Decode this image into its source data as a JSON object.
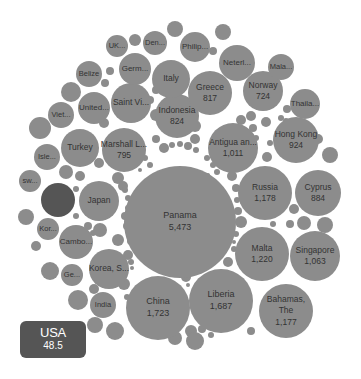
{
  "chart_data": {
    "type": "bubble",
    "title": "",
    "highlighted": "USA",
    "colors": {
      "bubble": "#8c8c8c",
      "highlight": "#555555",
      "label": "#333333",
      "tooltip_bg": "#555555",
      "tooltip_text": "#ffffff"
    },
    "bubbles": [
      {
        "label": "Panama",
        "value": "5,473",
        "cx": 180,
        "cy": 222,
        "r": 56
      },
      {
        "label": "China",
        "value": "1,723",
        "cx": 158,
        "cy": 308,
        "r": 32
      },
      {
        "label": "Liberia",
        "value": "1,687",
        "cx": 221,
        "cy": 301,
        "r": 32
      },
      {
        "label": "Malta",
        "value": "1,220",
        "cx": 262,
        "cy": 254,
        "r": 27
      },
      {
        "label": "Russia",
        "value": "1,178",
        "cx": 265,
        "cy": 193,
        "r": 27
      },
      {
        "label": "Bahamas, The",
        "value": "1,177",
        "cx": 286,
        "cy": 311,
        "r": 27
      },
      {
        "label": "Singapore",
        "value": "1,063",
        "cx": 315,
        "cy": 256,
        "r": 25
      },
      {
        "label": "Antigua an...",
        "value": "1,011",
        "cx": 233,
        "cy": 148,
        "r": 25
      },
      {
        "label": "Hong Kong",
        "value": "924",
        "cx": 296,
        "cy": 140,
        "r": 23
      },
      {
        "label": "Cyprus",
        "value": "884",
        "cx": 318,
        "cy": 193,
        "r": 23
      },
      {
        "label": "Indonesia",
        "value": "824",
        "cx": 177,
        "cy": 116,
        "r": 22
      },
      {
        "label": "Greece",
        "value": "817",
        "cx": 210,
        "cy": 93,
        "r": 22
      },
      {
        "label": "Marshall L...",
        "value": "795",
        "cx": 124,
        "cy": 150,
        "r": 22
      },
      {
        "label": "Norway",
        "value": "724",
        "cx": 263,
        "cy": 91,
        "r": 20
      },
      {
        "label": "Japan",
        "value": "",
        "cx": 99,
        "cy": 201,
        "r": 20
      },
      {
        "label": "Turkey",
        "value": "",
        "cx": 80,
        "cy": 148,
        "r": 19
      },
      {
        "label": "Saint Vi...",
        "value": "",
        "cx": 131,
        "cy": 103,
        "r": 20
      },
      {
        "label": "Italy",
        "value": "",
        "cx": 171,
        "cy": 79,
        "r": 19
      },
      {
        "label": "Korea, S...",
        "value": "",
        "cx": 109,
        "cy": 269,
        "r": 20
      },
      {
        "label": "Cambo...",
        "value": "",
        "cx": 76,
        "cy": 242,
        "r": 17
      },
      {
        "label": "United...",
        "value": "",
        "cx": 94,
        "cy": 108,
        "r": 16
      },
      {
        "label": "Germ...",
        "value": "",
        "cx": 135,
        "cy": 69,
        "r": 16
      },
      {
        "label": "Neterl...",
        "value": "",
        "cx": 237,
        "cy": 63,
        "r": 18
      },
      {
        "label": "Thaila...",
        "value": "",
        "cx": 305,
        "cy": 104,
        "r": 15
      },
      {
        "label": "Philip...",
        "value": "",
        "cx": 195,
        "cy": 47,
        "r": 15
      },
      {
        "label": "Belize",
        "value": "",
        "cx": 89,
        "cy": 74,
        "r": 13
      },
      {
        "label": "Viet...",
        "value": "",
        "cx": 61,
        "cy": 115,
        "r": 13
      },
      {
        "label": "Isle...",
        "value": "",
        "cx": 47,
        "cy": 157,
        "r": 13
      },
      {
        "label": "India",
        "value": "",
        "cx": 103,
        "cy": 305,
        "r": 13
      },
      {
        "label": "Den...",
        "value": "",
        "cx": 155,
        "cy": 43,
        "r": 12
      },
      {
        "label": "UK...",
        "value": "",
        "cx": 117,
        "cy": 46,
        "r": 11
      },
      {
        "label": "Mala...",
        "value": "",
        "cx": 281,
        "cy": 67,
        "r": 13
      },
      {
        "label": "Ge...",
        "value": "",
        "cx": 72,
        "cy": 275,
        "r": 11
      },
      {
        "label": "Kor...",
        "value": "",
        "cx": 48,
        "cy": 229,
        "r": 11
      },
      {
        "label": "sw...",
        "value": "",
        "cx": 30,
        "cy": 181,
        "r": 11
      },
      {
        "label": "",
        "value": "",
        "cx": 58,
        "cy": 200,
        "r": 17,
        "highlight": true
      }
    ],
    "small_bubbles": [
      {
        "cx": 135,
        "cy": 40,
        "r": 6
      },
      {
        "cx": 175,
        "cy": 29,
        "r": 8
      },
      {
        "cx": 223,
        "cy": 32,
        "r": 8
      },
      {
        "cx": 213,
        "cy": 51,
        "r": 4
      },
      {
        "cx": 110,
        "cy": 71,
        "r": 4
      },
      {
        "cx": 105,
        "cy": 83,
        "r": 4
      },
      {
        "cx": 40,
        "cy": 128,
        "r": 11
      },
      {
        "cx": 71,
        "cy": 92,
        "r": 10
      },
      {
        "cx": 26,
        "cy": 217,
        "r": 8
      },
      {
        "cx": 36,
        "cy": 246,
        "r": 5
      },
      {
        "cx": 50,
        "cy": 271,
        "r": 9
      },
      {
        "cx": 78,
        "cy": 300,
        "r": 10
      },
      {
        "cx": 95,
        "cy": 325,
        "r": 8
      },
      {
        "cx": 115,
        "cy": 331,
        "r": 9
      },
      {
        "cx": 66,
        "cy": 172,
        "r": 7
      },
      {
        "cx": 80,
        "cy": 176,
        "r": 5
      },
      {
        "cx": 76,
        "cy": 189,
        "r": 3
      },
      {
        "cx": 76,
        "cy": 216,
        "r": 3
      },
      {
        "cx": 99,
        "cy": 163,
        "r": 5
      },
      {
        "cx": 118,
        "cy": 178,
        "r": 6
      },
      {
        "cx": 123,
        "cy": 186,
        "r": 5
      },
      {
        "cx": 104,
        "cy": 123,
        "r": 5
      },
      {
        "cx": 156,
        "cy": 115,
        "r": 6
      },
      {
        "cx": 150,
        "cy": 100,
        "r": 4
      },
      {
        "cx": 156,
        "cy": 90,
        "r": 4
      },
      {
        "cx": 166,
        "cy": 104,
        "r": 3
      },
      {
        "cx": 195,
        "cy": 126,
        "r": 6
      },
      {
        "cx": 195,
        "cy": 139,
        "r": 5
      },
      {
        "cx": 156,
        "cy": 139,
        "r": 4
      },
      {
        "cx": 164,
        "cy": 148,
        "r": 5
      },
      {
        "cx": 172,
        "cy": 145,
        "r": 3
      },
      {
        "cx": 180,
        "cy": 144,
        "r": 3
      },
      {
        "cx": 188,
        "cy": 146,
        "r": 4
      },
      {
        "cx": 196,
        "cy": 150,
        "r": 3
      },
      {
        "cx": 145,
        "cy": 158,
        "r": 3
      },
      {
        "cx": 150,
        "cy": 165,
        "r": 3
      },
      {
        "cx": 140,
        "cy": 170,
        "r": 2
      },
      {
        "cx": 207,
        "cy": 158,
        "r": 3
      },
      {
        "cx": 213,
        "cy": 165,
        "r": 3
      },
      {
        "cx": 217,
        "cy": 172,
        "r": 3
      },
      {
        "cx": 208,
        "cy": 175,
        "r": 2
      },
      {
        "cx": 232,
        "cy": 176,
        "r": 5
      },
      {
        "cx": 236,
        "cy": 188,
        "r": 4
      },
      {
        "cx": 237,
        "cy": 200,
        "r": 3
      },
      {
        "cx": 238,
        "cy": 211,
        "r": 4
      },
      {
        "cx": 241,
        "cy": 222,
        "r": 6
      },
      {
        "cx": 236,
        "cy": 234,
        "r": 3
      },
      {
        "cx": 234,
        "cy": 242,
        "r": 2
      },
      {
        "cx": 234,
        "cy": 249,
        "r": 3
      },
      {
        "cx": 241,
        "cy": 120,
        "r": 5
      },
      {
        "cx": 251,
        "cy": 116,
        "r": 5
      },
      {
        "cx": 253,
        "cy": 128,
        "r": 4
      },
      {
        "cx": 266,
        "cy": 122,
        "r": 5
      },
      {
        "cx": 270,
        "cy": 143,
        "r": 3
      },
      {
        "cx": 267,
        "cy": 157,
        "r": 5
      },
      {
        "cx": 281,
        "cy": 118,
        "r": 3
      },
      {
        "cx": 287,
        "cy": 109,
        "r": 4
      },
      {
        "cx": 286,
        "cy": 121,
        "r": 3
      },
      {
        "cx": 318,
        "cy": 139,
        "r": 5
      },
      {
        "cx": 330,
        "cy": 155,
        "r": 8
      },
      {
        "cx": 294,
        "cy": 209,
        "r": 5
      },
      {
        "cx": 290,
        "cy": 224,
        "r": 4
      },
      {
        "cx": 304,
        "cy": 223,
        "r": 7
      },
      {
        "cx": 325,
        "cy": 225,
        "r": 8
      },
      {
        "cx": 273,
        "cy": 224,
        "r": 3
      },
      {
        "cx": 256,
        "cy": 138,
        "r": 3
      },
      {
        "cx": 228,
        "cy": 262,
        "r": 5
      },
      {
        "cx": 240,
        "cy": 286,
        "r": 4
      },
      {
        "cx": 251,
        "cy": 331,
        "r": 4
      },
      {
        "cx": 186,
        "cy": 277,
        "r": 5
      },
      {
        "cx": 188,
        "cy": 285,
        "r": 2
      },
      {
        "cx": 191,
        "cy": 331,
        "r": 6
      },
      {
        "cx": 195,
        "cy": 341,
        "r": 9
      },
      {
        "cx": 175,
        "cy": 338,
        "r": 7
      },
      {
        "cx": 211,
        "cy": 335,
        "r": 3
      },
      {
        "cx": 202,
        "cy": 329,
        "r": 4
      },
      {
        "cx": 252,
        "cy": 270,
        "r": 3
      },
      {
        "cx": 131,
        "cy": 241,
        "r": 4
      },
      {
        "cx": 128,
        "cy": 255,
        "r": 5
      },
      {
        "cx": 131,
        "cy": 262,
        "r": 3
      },
      {
        "cx": 132,
        "cy": 268,
        "r": 2
      },
      {
        "cx": 125,
        "cy": 190,
        "r": 3
      },
      {
        "cx": 128,
        "cy": 198,
        "r": 3
      },
      {
        "cx": 128,
        "cy": 208,
        "r": 3
      },
      {
        "cx": 125,
        "cy": 216,
        "r": 4
      },
      {
        "cx": 127,
        "cy": 226,
        "r": 4
      },
      {
        "cx": 88,
        "cy": 226,
        "r": 4
      },
      {
        "cx": 93,
        "cy": 233,
        "r": 3
      },
      {
        "cx": 100,
        "cy": 230,
        "r": 7
      },
      {
        "cx": 118,
        "cy": 240,
        "r": 6
      },
      {
        "cx": 124,
        "cy": 284,
        "r": 6
      },
      {
        "cx": 127,
        "cy": 297,
        "r": 3
      },
      {
        "cx": 94,
        "cy": 289,
        "r": 5
      }
    ],
    "tooltip": {
      "label": "USA",
      "value": "48.5"
    }
  }
}
